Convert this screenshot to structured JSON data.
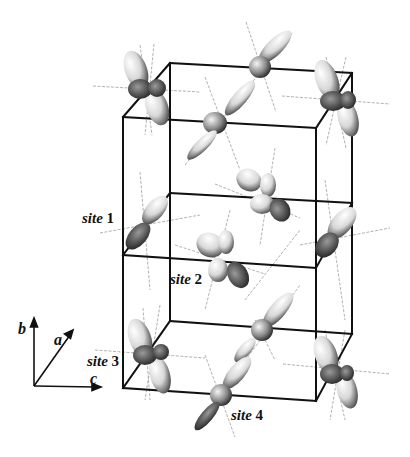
{
  "figure": {
    "labels": {
      "site1": {
        "word": "site",
        "num": "1"
      },
      "site2": {
        "word": "site",
        "num": "2"
      },
      "site3": {
        "word": "site",
        "num": "3"
      },
      "site4": {
        "word": "site",
        "num": "4"
      }
    },
    "axes": {
      "b": "b",
      "a": "a",
      "c": "c"
    },
    "colors": {
      "frame": "#111111",
      "orbital_light": "#f2f2f2",
      "orbital_dark": "#3a3a3a",
      "bond_line": "#9a9a9a"
    }
  }
}
